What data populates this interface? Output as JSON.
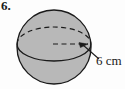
{
  "figure": {
    "problem_number": "6.",
    "dimension_label": "6 cm",
    "shape_name": "sphere",
    "colors": {
      "background": "#fdfdfd",
      "sphere_fill": "#b8b8b8",
      "outline": "#1a1a1a",
      "text": "#1a1a1a"
    },
    "geometry": {
      "circle_center_x": 54,
      "circle_center_y": 47,
      "circle_radius": 37,
      "equator_center_y": 44,
      "equator_rx": 37,
      "equator_ry": 17,
      "radius_line_start_x": 53,
      "radius_line_end_x": 87,
      "radius_line_y": 44,
      "leader_start_x": 84,
      "leader_start_y": 46,
      "leader_end_x": 99,
      "leader_end_y": 59
    },
    "elements": {
      "sphere_circle": "sphere-outline-circle",
      "equator_back": "equator-dashed-back-arc",
      "equator_front": "equator-solid-front-arc",
      "radius_line": "radius-dashed-line",
      "radius_arrow": "radius-arrowhead",
      "leader_line": "dimension-leader-line"
    }
  }
}
